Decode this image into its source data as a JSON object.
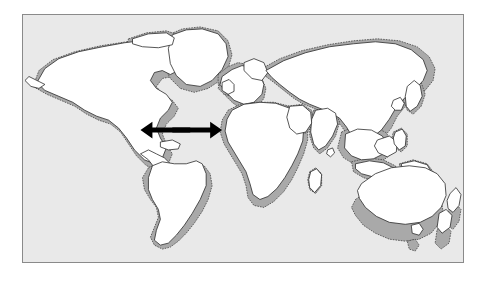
{
  "figure": {
    "kind": "world-map-diagram",
    "title": "",
    "caption": "",
    "background_color": "#ffffff",
    "frame": {
      "border_color": "#8a8a8a",
      "border_width_px": 1,
      "left": 22,
      "top": 14,
      "width": 442,
      "height": 249
    },
    "map": {
      "ocean_color": "#e9e9e9",
      "land_fill": "#ffffff",
      "land_outline": "#2b2b2b",
      "shelf_fill": "#a9a9a9",
      "shelf_outline": "#333333",
      "shelf_outline_style": "dotted",
      "projection_hint": "equirectangular"
    },
    "annotations": {
      "arrows": [
        {
          "name": "atlantic-divergence-arrow-west",
          "direction": "west",
          "color": "#000000",
          "label": "",
          "tail_x": 190,
          "tail_y": 125,
          "tip_x": 142,
          "tip_y": 125
        },
        {
          "name": "atlantic-divergence-arrow-east",
          "direction": "east",
          "color": "#000000",
          "label": "",
          "tail_x": 172,
          "tail_y": 125,
          "tip_x": 220,
          "tip_y": 125
        }
      ],
      "arrow_count": 2,
      "meaning": "divergent plate motion / seafloor spreading across the Atlantic"
    },
    "landmasses": [
      {
        "name": "north-america",
        "has_shelf": true
      },
      {
        "name": "greenland",
        "has_shelf": true
      },
      {
        "name": "iceland",
        "has_shelf": false
      },
      {
        "name": "south-america",
        "has_shelf": true
      },
      {
        "name": "europe",
        "has_shelf": true
      },
      {
        "name": "africa",
        "has_shelf": true
      },
      {
        "name": "asia",
        "has_shelf": true
      },
      {
        "name": "india",
        "has_shelf": true
      },
      {
        "name": "southeast-asia-islands",
        "has_shelf": true
      },
      {
        "name": "japan",
        "has_shelf": true
      },
      {
        "name": "australia",
        "has_shelf": true
      },
      {
        "name": "new-zealand",
        "has_shelf": true
      },
      {
        "name": "madagascar",
        "has_shelf": true
      },
      {
        "name": "british-isles",
        "has_shelf": true
      },
      {
        "name": "arctic-islands",
        "has_shelf": true
      }
    ],
    "legend": {
      "present": false,
      "entries": []
    },
    "labels": []
  }
}
